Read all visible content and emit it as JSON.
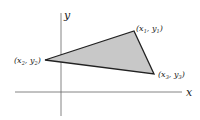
{
  "diagram": {
    "axes": {
      "x_label": "x",
      "y_label": "y"
    },
    "vertices": [
      {
        "id": "p1",
        "label_main": "(x",
        "sub": "1",
        "sep": ", y",
        "sub2": "1",
        "close": ")",
        "px": 134,
        "py": 31
      },
      {
        "id": "p2",
        "label_main": "(x",
        "sub": "2",
        "sep": ", y",
        "sub2": "2",
        "close": ")",
        "px": 45,
        "py": 60
      },
      {
        "id": "p3",
        "label_main": "(x",
        "sub": "3",
        "sep": ", y",
        "sub2": "3",
        "close": ")",
        "px": 154,
        "py": 74
      }
    ],
    "colors": {
      "fill": "#c8c8c8",
      "stroke": "#222222",
      "axis": "#555555"
    }
  }
}
